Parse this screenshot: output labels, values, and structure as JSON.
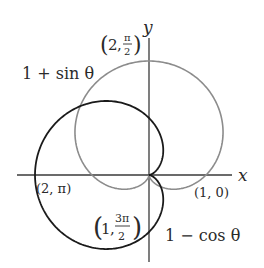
{
  "diagram": {
    "type": "polar-curves",
    "origin_px": [
      149,
      175
    ],
    "scale_px_per_unit": 57,
    "axes": {
      "x_label": "x",
      "y_label": "y",
      "color": "#3a3a3a"
    },
    "curves": [
      {
        "name": "1 + sin θ",
        "label": "1 + sin θ",
        "equation": "r = 1 + sin(theta)",
        "color": "#8c8c8c"
      },
      {
        "name": "1 − cos θ",
        "label": "1 − cos θ",
        "equation": "r = 1 - cos(theta)",
        "color": "#1a1a1a"
      }
    ],
    "points": [
      {
        "label_r": "2",
        "label_theta_num": "π",
        "label_theta_den": "2",
        "x": 0,
        "y": 2
      },
      {
        "label": "(2, π)",
        "x": -2,
        "y": 0
      },
      {
        "label": "(1, 0)",
        "x": 1,
        "y": 0
      },
      {
        "label_r": "1",
        "label_theta_num": "3π",
        "label_theta_den": "2",
        "x": 0,
        "y": -1
      }
    ]
  }
}
